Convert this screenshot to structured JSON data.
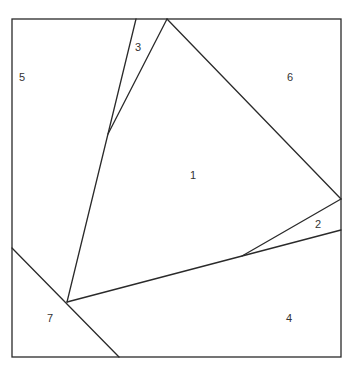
{
  "diagram": {
    "type": "partition",
    "frame": {
      "x1": 12,
      "y1": 19,
      "x2": 341,
      "y2": 357
    },
    "lines": [
      {
        "x1": 136,
        "y1": 19,
        "x2": 67,
        "y2": 302
      },
      {
        "x1": 167,
        "y1": 19,
        "x2": 108,
        "y2": 134
      },
      {
        "x1": 167,
        "y1": 19,
        "x2": 341,
        "y2": 199
      },
      {
        "x1": 341,
        "y1": 199,
        "x2": 242,
        "y2": 256
      },
      {
        "x1": 67,
        "y1": 302,
        "x2": 341,
        "y2": 230
      },
      {
        "x1": 12,
        "y1": 248,
        "x2": 119,
        "y2": 357
      }
    ],
    "regions": [
      {
        "id": "1",
        "label": "1",
        "x": 193,
        "y": 176
      },
      {
        "id": "2",
        "label": "2",
        "x": 318,
        "y": 225
      },
      {
        "id": "3",
        "label": "3",
        "x": 138,
        "y": 48
      },
      {
        "id": "4",
        "label": "4",
        "x": 289,
        "y": 319
      },
      {
        "id": "5",
        "label": "5",
        "x": 22,
        "y": 78
      },
      {
        "id": "6",
        "label": "6",
        "x": 290,
        "y": 78
      },
      {
        "id": "7",
        "label": "7",
        "x": 50,
        "y": 319
      }
    ]
  }
}
